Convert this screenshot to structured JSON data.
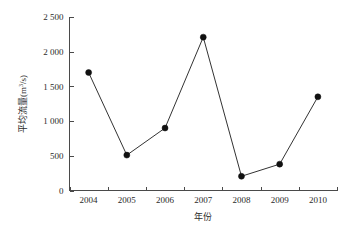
{
  "chart_data": {
    "type": "line",
    "title": "",
    "xlabel": "年份",
    "ylabel": "平均流量(m³/s)",
    "ylabel_base": "平均流量(m",
    "ylabel_sup": "3",
    "ylabel_tail": "/s)",
    "categories": [
      "2004",
      "2005",
      "2006",
      "2007",
      "2008",
      "2009",
      "2010"
    ],
    "values": [
      1700,
      510,
      900,
      2210,
      205,
      380,
      1350
    ],
    "series": [
      {
        "name": "平均流量",
        "values": [
          1700,
          510,
          900,
          2210,
          205,
          380,
          1350
        ]
      }
    ],
    "ylim": [
      0,
      2500
    ],
    "ytick_values": [
      0,
      500,
      1000,
      1500,
      2000,
      2500
    ],
    "ytick_labels": [
      "0",
      "500",
      "1 000",
      "1 500",
      "2 000",
      "2 500"
    ],
    "xtick_labels": [
      "2004",
      "2005",
      "2006",
      "2007",
      "2008",
      "2009",
      "2010"
    ],
    "grid": false,
    "legend": "none",
    "marker": "filled-circle",
    "line_color": "#333333",
    "marker_color": "#111111",
    "axis_color": "#4a4a4a",
    "background_color": "#ffffff"
  }
}
